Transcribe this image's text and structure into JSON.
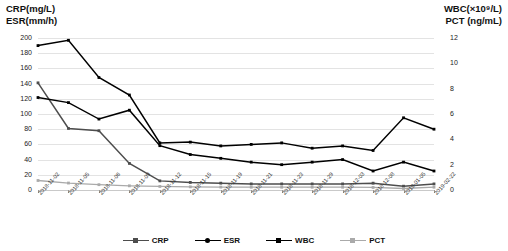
{
  "left_axis_title": "CRP(mg/L)\nESR(mm/h)",
  "right_axis_title": "WBC(×10⁹/L)\nPCT (ng/mL)",
  "colors": {
    "crp": "#4d4d4d",
    "esr": "#000000",
    "wbc": "#000000",
    "pct": "#aaaaaa",
    "grid": "#e3e3e3"
  },
  "legend": [
    {
      "label": "CRP",
      "color": "#4d4d4d",
      "marker": "square"
    },
    {
      "label": "ESR",
      "color": "#000000",
      "marker": "circle"
    },
    {
      "label": "WBC",
      "color": "#000000",
      "marker": "square"
    },
    {
      "label": "PCT",
      "color": "#aaaaaa",
      "marker": "square"
    }
  ],
  "chart_data": {
    "type": "line",
    "title": "",
    "xlabel": "",
    "ylabel": "CRP(mg/L) ESR(mm/h)",
    "y2label": "WBC(×10⁹/L) PCT (ng/mL)",
    "ylim": [
      0,
      200
    ],
    "y2lim": [
      0,
      12
    ],
    "yticks": [
      0,
      20,
      40,
      60,
      80,
      100,
      120,
      140,
      160,
      180,
      200
    ],
    "y2ticks": [
      0,
      2,
      4,
      6,
      8,
      10,
      12
    ],
    "grid": true,
    "legend_position": "bottom",
    "categories": [
      "2018-11-02",
      "2018-11-05",
      "2018-11-06",
      "2018-11-09",
      "2018-11-12",
      "2018-11-15",
      "2018-11-19",
      "2018-11-21",
      "2018-11-23",
      "2018-11-29",
      "2018-12-03",
      "2018-12-08",
      "2019-01-05",
      "2019-02-22"
    ],
    "series": [
      {
        "name": "CRP",
        "axis": "left",
        "color": "#4d4d4d",
        "values": [
          141,
          81,
          78,
          35,
          12,
          10,
          9,
          8,
          8,
          8,
          8,
          9,
          5,
          8
        ]
      },
      {
        "name": "ESR",
        "axis": "left",
        "color": "#000000",
        "values": [
          190,
          197,
          148,
          125,
          62,
          63,
          58,
          60,
          62,
          55,
          58,
          52,
          95,
          80
        ]
      },
      {
        "name": "WBC",
        "axis": "right",
        "color": "#000000",
        "values": [
          7.3,
          6.9,
          5.6,
          6.3,
          3.5,
          2.8,
          2.5,
          2.2,
          2.0,
          2.2,
          2.4,
          1.5,
          2.2,
          1.5
        ]
      },
      {
        "name": "PCT",
        "axis": "right",
        "color": "#aaaaaa",
        "values": [
          0.75,
          0.55,
          0.42,
          0.33,
          0.28,
          0.25,
          0.23,
          0.22,
          0.22,
          0.22,
          0.22,
          0.2,
          0.12,
          0.22
        ]
      }
    ]
  }
}
